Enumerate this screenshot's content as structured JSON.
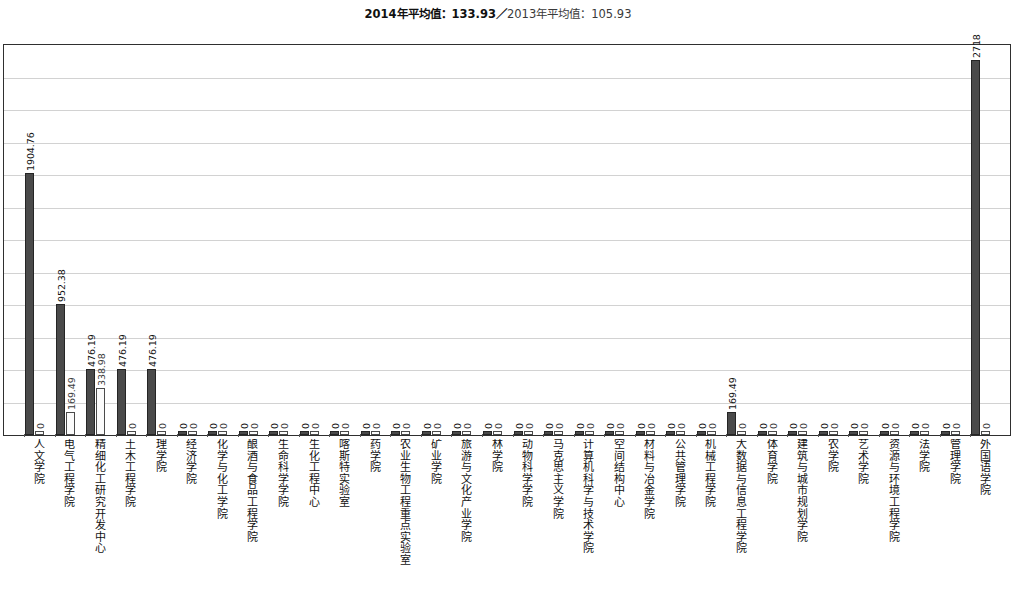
{
  "header": {
    "avg_2014_text": "2014年平均值：133.93",
    "separator": "／",
    "avg_2013_text": "2013年平均值：105.93"
  },
  "legend": {
    "series_2014_name": "2014年",
    "series_2013_name": "2013年",
    "color_2014": "#4a4a4a",
    "color_2013": "#fbfbfb"
  },
  "axis": {
    "y_min": 0,
    "y_max": 2830,
    "gridline_count": 11,
    "grid_on": true
  },
  "chart_data": {
    "type": "bar",
    "title": "",
    "subtitle": "2014年平均值：133.93／2013年平均值：105.93",
    "xlabel": "",
    "ylabel": "",
    "ylim": [
      0,
      2830
    ],
    "grid": true,
    "legend_position": "none",
    "categories": [
      "人文学院",
      "电气工程学院",
      "精细化工研究开发中心",
      "土木工程学院",
      "理学院",
      "经济学院",
      "化学与化工学院",
      "酿酒与食品工程学院",
      "生命科学学院",
      "生化工程中心",
      "喀斯特实验室",
      "药学院",
      "农业生物工程重点实验室",
      "矿业学院",
      "旅游与文化产业学院",
      "林学院",
      "动物科学学院",
      "马克思主义学院",
      "计算机科学与技术学院",
      "空间结构中心",
      "材料与冶金学院",
      "公共管理学院",
      "机械工程学院",
      "大数据与信息工程学院",
      "体育学院",
      "建筑与城市规划学院",
      "农学院",
      "艺术学院",
      "资源与环境工程学院",
      "法学院",
      "管理学院",
      "外国语学院"
    ],
    "series": [
      {
        "name": "2014年",
        "color": "#4a4a4a",
        "values": [
          1904.76,
          952.38,
          476.19,
          476.19,
          476.19,
          0,
          0,
          0,
          0,
          0,
          0,
          0,
          0,
          0,
          0,
          0,
          0,
          0,
          0,
          0,
          0,
          0,
          0,
          169.49,
          0,
          0,
          0,
          0,
          0,
          0,
          0,
          2718.0
        ],
        "labels": [
          "1904.76",
          "952.38",
          "476.19",
          "476.19",
          "476.19",
          "0",
          "0",
          "0",
          "0",
          "0",
          "0",
          "0",
          "0",
          "0",
          "0",
          "0",
          "0",
          "0",
          "0",
          "0",
          "0",
          "0",
          "0",
          "169.49",
          "0",
          "0",
          "0",
          "0",
          "0",
          "0",
          "0",
          "2718"
        ]
      },
      {
        "name": "2013年",
        "color": "#fbfbfb",
        "values": [
          0,
          169.49,
          338.98,
          0,
          0,
          0,
          0,
          0,
          0,
          0,
          0,
          0,
          0,
          0,
          0,
          0,
          0,
          0,
          0,
          0,
          0,
          0,
          0,
          0,
          0,
          0,
          0,
          0,
          0,
          0,
          0,
          0
        ],
        "labels": [
          "0",
          "169.49",
          "338.98",
          "0",
          "0",
          "0",
          "0",
          "0",
          "0",
          "0",
          "0",
          "0",
          "0",
          "0",
          "0",
          "0",
          "0",
          "0",
          "0",
          "0",
          "0",
          "0",
          "0",
          "0",
          "0",
          "0",
          "0",
          "0",
          "0",
          "0",
          "0",
          "0"
        ]
      }
    ]
  }
}
